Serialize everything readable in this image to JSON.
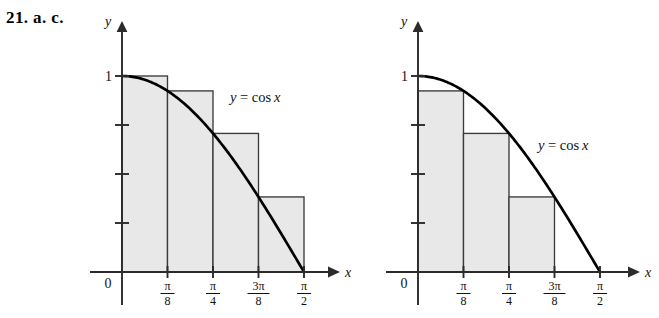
{
  "figure": {
    "problem_label": "21. a. c.",
    "background_color": "#ffffff",
    "bar_fill_color": "#e8e8e8",
    "bar_edge_color": "#3a3a3a",
    "axis_color": "#2b2b2b",
    "curve_color": "#000000"
  },
  "charts": [
    {
      "id": "left",
      "part": "a",
      "curve_label": "y = cos x",
      "axis_x_label": "x",
      "axis_y_label": "y",
      "origin_label": "0",
      "y_axis_label_one": "1",
      "type": "Riemann sum, left endpoints (upper sum)",
      "x_tick_labels": [
        {
          "numerator": "π",
          "denominator": "8"
        },
        {
          "numerator": "π",
          "denominator": "4"
        },
        {
          "numerator": "3π",
          "denominator": "8"
        },
        {
          "numerator": "π",
          "denominator": "2"
        }
      ],
      "y_tick_values": [
        0.25,
        0.5,
        0.75,
        1
      ],
      "bar_heights": [
        1,
        0.924,
        0.707,
        0.383
      ]
    },
    {
      "id": "right",
      "part": "c",
      "curve_label": "y = cos x",
      "axis_x_label": "x",
      "axis_y_label": "y",
      "origin_label": "0",
      "y_axis_label_one": "1",
      "type": "Riemann sum, right endpoints (lower sum)",
      "x_tick_labels": [
        {
          "numerator": "π",
          "denominator": "8"
        },
        {
          "numerator": "π",
          "denominator": "4"
        },
        {
          "numerator": "3π",
          "denominator": "8"
        },
        {
          "numerator": "π",
          "denominator": "2"
        }
      ],
      "y_tick_values": [
        0.25,
        0.5,
        0.75,
        1
      ],
      "bar_heights": [
        0.924,
        0.707,
        0.383,
        0
      ]
    }
  ],
  "chart_data": [
    {
      "type": "bar",
      "title": "",
      "subtitle": "Left-endpoint (upper) Riemann sum for y = cos x on [0, π/2], n = 4",
      "xlabel": "x",
      "ylabel": "y",
      "categories": [
        "0",
        "π/8",
        "π/4",
        "3π/8"
      ],
      "values": [
        1,
        0.924,
        0.707,
        0.383
      ],
      "bar_intervals": [
        [
          "0",
          "π/8"
        ],
        [
          "π/8",
          "π/4"
        ],
        [
          "π/4",
          "3π/8"
        ],
        [
          "3π/8",
          "π/2"
        ]
      ],
      "xlim": [
        0,
        1.7279
      ],
      "ylim": [
        0,
        1.12
      ],
      "x_tick_labels": [
        "π/8",
        "π/4",
        "3π/8",
        "π/2"
      ],
      "x_tick_values": [
        0.3927,
        0.7854,
        1.1781,
        1.5708
      ],
      "y_tick_values": [
        0.25,
        0.5,
        0.75,
        1
      ],
      "y_tick_labels": [
        "",
        "",
        "",
        "1"
      ],
      "grid": false,
      "legend": false,
      "annotations": [
        "y = cos x"
      ],
      "overlay_curve": {
        "name": "y = cos x",
        "function": "cos(x)",
        "x_range": [
          0,
          1.5708
        ]
      }
    },
    {
      "type": "bar",
      "title": "",
      "subtitle": "Right-endpoint (lower) Riemann sum for y = cos x on [0, π/2], n = 4",
      "xlabel": "x",
      "ylabel": "y",
      "categories": [
        "π/8",
        "π/4",
        "3π/8",
        "π/2"
      ],
      "values": [
        0.924,
        0.707,
        0.383,
        0
      ],
      "bar_intervals": [
        [
          "0",
          "π/8"
        ],
        [
          "π/8",
          "π/4"
        ],
        [
          "π/4",
          "3π/8"
        ],
        [
          "3π/8",
          "π/2"
        ]
      ],
      "xlim": [
        0,
        1.7279
      ],
      "ylim": [
        0,
        1.12
      ],
      "x_tick_labels": [
        "π/8",
        "π/4",
        "3π/8",
        "π/2"
      ],
      "x_tick_values": [
        0.3927,
        0.7854,
        1.1781,
        1.5708
      ],
      "y_tick_values": [
        0.25,
        0.5,
        0.75,
        1
      ],
      "y_tick_labels": [
        "",
        "",
        "",
        "1"
      ],
      "grid": false,
      "legend": false,
      "annotations": [
        "y = cos x"
      ],
      "overlay_curve": {
        "name": "y = cos x",
        "function": "cos(x)",
        "x_range": [
          0,
          1.5708
        ]
      }
    }
  ]
}
